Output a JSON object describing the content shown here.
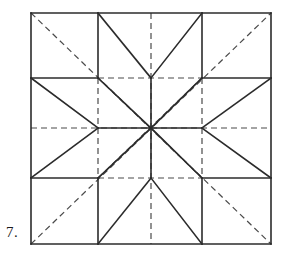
{
  "figure": {
    "label": "7.",
    "background_color": "#ffffff",
    "solid_color": "#2b2b2b",
    "dashed_color": "#4a4a4a",
    "solid_width": 1.6,
    "dashed_width": 1.2,
    "dash_pattern": "6,4",
    "geometry": {
      "x_grid": [
        31,
        98,
        151,
        202,
        271
      ],
      "y_grid": [
        13,
        78,
        128,
        178,
        244
      ],
      "center": [
        151,
        128
      ],
      "outer_square": {
        "left": 31,
        "top": 13,
        "right": 271,
        "bottom": 244
      }
    },
    "solid_lines": [
      {
        "name": "border-top",
        "x1": 31,
        "y1": 13,
        "x2": 271,
        "y2": 13
      },
      {
        "name": "border-right",
        "x1": 271,
        "y1": 13,
        "x2": 271,
        "y2": 244
      },
      {
        "name": "border-bottom",
        "x1": 31,
        "y1": 244,
        "x2": 271,
        "y2": 244
      },
      {
        "name": "border-left",
        "x1": 31,
        "y1": 13,
        "x2": 31,
        "y2": 244
      },
      {
        "name": "grid-h-upper-left",
        "x1": 31,
        "y1": 78,
        "x2": 98,
        "y2": 78
      },
      {
        "name": "grid-h-upper-right",
        "x1": 202,
        "y1": 78,
        "x2": 271,
        "y2": 78
      },
      {
        "name": "grid-h-lower-left",
        "x1": 31,
        "y1": 178,
        "x2": 98,
        "y2": 178
      },
      {
        "name": "grid-h-lower-right",
        "x1": 202,
        "y1": 178,
        "x2": 271,
        "y2": 178
      },
      {
        "name": "grid-v-left-top",
        "x1": 98,
        "y1": 13,
        "x2": 98,
        "y2": 78
      },
      {
        "name": "grid-v-right-top",
        "x1": 202,
        "y1": 13,
        "x2": 202,
        "y2": 78
      },
      {
        "name": "grid-v-left-bottom",
        "x1": 98,
        "y1": 178,
        "x2": 98,
        "y2": 244
      },
      {
        "name": "grid-v-right-bottom",
        "x1": 202,
        "y1": 178,
        "x2": 202,
        "y2": 244
      },
      {
        "name": "star-point-top-left-edge",
        "x1": 98,
        "y1": 13,
        "x2": 151,
        "y2": 78
      },
      {
        "name": "star-point-top-right-edge",
        "x1": 202,
        "y1": 13,
        "x2": 151,
        "y2": 78
      },
      {
        "name": "star-point-bottom-left-edge",
        "x1": 98,
        "y1": 244,
        "x2": 151,
        "y2": 178
      },
      {
        "name": "star-point-bottom-right-edge",
        "x1": 202,
        "y1": 244,
        "x2": 151,
        "y2": 178
      },
      {
        "name": "star-point-left-top-edge",
        "x1": 31,
        "y1": 78,
        "x2": 98,
        "y2": 128
      },
      {
        "name": "star-point-left-bottom-edge",
        "x1": 31,
        "y1": 178,
        "x2": 98,
        "y2": 128
      },
      {
        "name": "star-point-right-top-edge",
        "x1": 271,
        "y1": 78,
        "x2": 202,
        "y2": 128
      },
      {
        "name": "star-point-right-bottom-edge",
        "x1": 271,
        "y1": 178,
        "x2": 202,
        "y2": 128
      },
      {
        "name": "star-diagonal-nw",
        "x1": 98,
        "y1": 78,
        "x2": 151,
        "y2": 128
      },
      {
        "name": "star-diagonal-ne",
        "x1": 202,
        "y1": 78,
        "x2": 151,
        "y2": 128
      },
      {
        "name": "star-diagonal-sw",
        "x1": 98,
        "y1": 178,
        "x2": 151,
        "y2": 128
      },
      {
        "name": "star-diagonal-se",
        "x1": 202,
        "y1": 178,
        "x2": 151,
        "y2": 128
      },
      {
        "name": "star-spoke-up",
        "x1": 151,
        "y1": 78,
        "x2": 151,
        "y2": 128
      },
      {
        "name": "star-spoke-down",
        "x1": 151,
        "y1": 178,
        "x2": 151,
        "y2": 128
      },
      {
        "name": "star-spoke-left",
        "x1": 98,
        "y1": 128,
        "x2": 151,
        "y2": 128
      },
      {
        "name": "star-spoke-right",
        "x1": 202,
        "y1": 128,
        "x2": 151,
        "y2": 128
      }
    ],
    "dashed_lines": [
      {
        "name": "construction-diagonal-nw-se",
        "x1": 31,
        "y1": 13,
        "x2": 271,
        "y2": 244
      },
      {
        "name": "construction-diagonal-sw-ne",
        "x1": 31,
        "y1": 244,
        "x2": 271,
        "y2": 13
      },
      {
        "name": "construction-center-horizontal",
        "x1": 31,
        "y1": 128,
        "x2": 271,
        "y2": 128
      },
      {
        "name": "construction-center-vertical",
        "x1": 151,
        "y1": 13,
        "x2": 151,
        "y2": 244
      },
      {
        "name": "construction-grid-h-upper",
        "x1": 98,
        "y1": 78,
        "x2": 202,
        "y2": 78
      },
      {
        "name": "construction-grid-h-lower",
        "x1": 98,
        "y1": 178,
        "x2": 202,
        "y2": 178
      },
      {
        "name": "construction-grid-v-left",
        "x1": 98,
        "y1": 78,
        "x2": 98,
        "y2": 178
      },
      {
        "name": "construction-grid-v-right",
        "x1": 202,
        "y1": 78,
        "x2": 202,
        "y2": 178
      },
      {
        "name": "construction-inner-diag-nw",
        "x1": 98,
        "y1": 178,
        "x2": 202,
        "y2": 78
      },
      {
        "name": "construction-inner-diag-ne",
        "x1": 98,
        "y1": 78,
        "x2": 202,
        "y2": 178
      }
    ]
  }
}
